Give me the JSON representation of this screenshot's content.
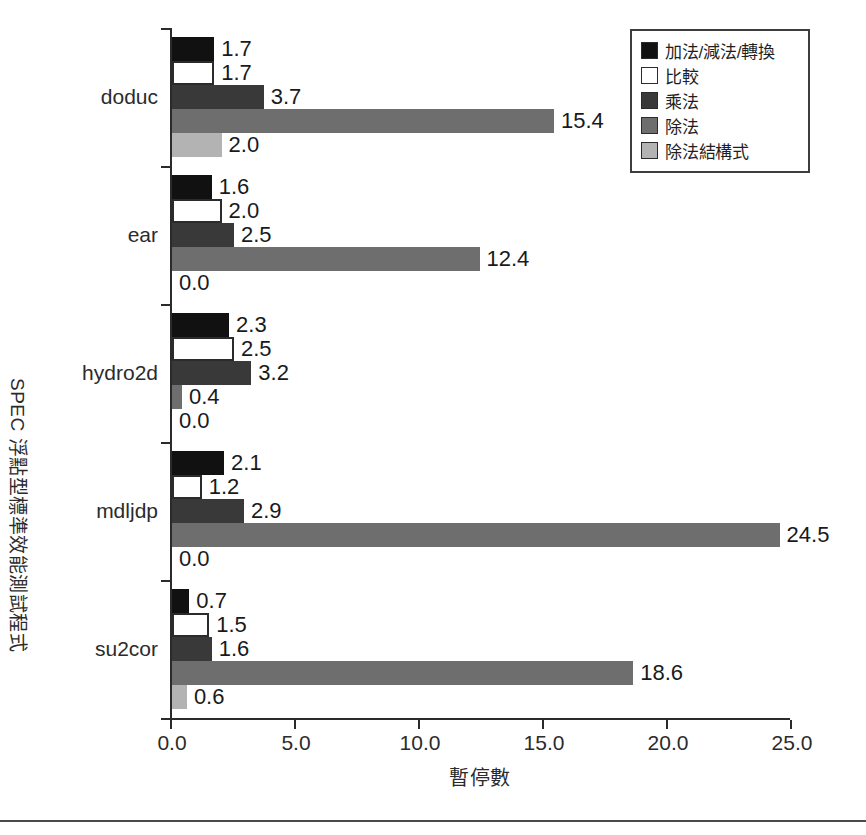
{
  "chart_data": {
    "type": "bar",
    "orientation": "horizontal",
    "title": "",
    "xlabel": "暫停數",
    "ylabel": "SPEC 浮點型標準效能測試程式",
    "xlim": [
      0.0,
      25.0
    ],
    "xticks": [
      "0.0",
      "5.0",
      "10.0",
      "15.0",
      "20.0",
      "25.0"
    ],
    "xtick_values": [
      0.0,
      5.0,
      10.0,
      15.0,
      20.0,
      25.0
    ],
    "grid": false,
    "legend_position": "top-right",
    "categories": [
      "doduc",
      "ear",
      "hydro2d",
      "mdljdp",
      "su2cor"
    ],
    "series": [
      {
        "name": "加法/減法/轉換",
        "color": "#111111",
        "values": [
          1.7,
          1.6,
          2.3,
          2.1,
          0.7
        ],
        "labels": [
          "1.7",
          "1.6",
          "2.3",
          "2.1",
          "0.7"
        ]
      },
      {
        "name": "比較",
        "color": "#ffffff",
        "values": [
          1.7,
          2.0,
          2.5,
          1.2,
          1.5
        ],
        "labels": [
          "1.7",
          "2.0",
          "2.5",
          "1.2",
          "1.5"
        ]
      },
      {
        "name": "乘法",
        "color": "#393939",
        "values": [
          3.7,
          2.5,
          3.2,
          2.9,
          1.6
        ],
        "labels": [
          "3.7",
          "2.5",
          "3.2",
          "2.9",
          "1.6"
        ]
      },
      {
        "name": "除法",
        "color": "#6e6e6e",
        "values": [
          15.4,
          12.4,
          0.4,
          24.5,
          18.6
        ],
        "labels": [
          "15.4",
          "12.4",
          "0.4",
          "24.5",
          "18.6"
        ]
      },
      {
        "name": "除法結構式",
        "color": "#b3b3b3",
        "values": [
          2.0,
          0.0,
          0.0,
          0.0,
          0.6
        ],
        "labels": [
          "2.0",
          "0.0",
          "0.0",
          "0.0",
          "0.6"
        ]
      }
    ]
  },
  "legend": {
    "items": [
      {
        "label": "加法/減法/轉換",
        "color": "#111111"
      },
      {
        "label": "比較",
        "color": "#ffffff"
      },
      {
        "label": "乘法",
        "color": "#393939"
      },
      {
        "label": "除法",
        "color": "#6e6e6e"
      },
      {
        "label": "除法結構式",
        "color": "#b3b3b3"
      }
    ]
  },
  "axes": {
    "x_title": "暫停數",
    "y_title": "SPEC 浮點型標準效能測試程式"
  }
}
